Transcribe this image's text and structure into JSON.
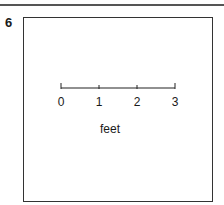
{
  "item": {
    "number": "6"
  },
  "scale": {
    "ticks": [
      {
        "label": "0",
        "x": 61
      },
      {
        "label": "1",
        "x": 99
      },
      {
        "label": "2",
        "x": 137
      },
      {
        "label": "3",
        "x": 175
      }
    ],
    "unit": "feet"
  }
}
